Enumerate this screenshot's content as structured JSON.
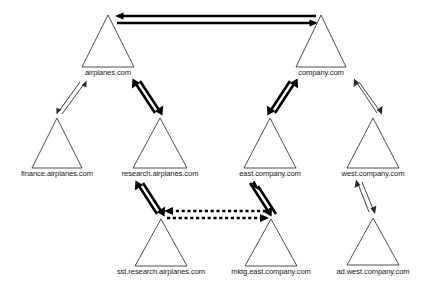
{
  "diagram": {
    "type": "tree-diagram",
    "shape": "triangle",
    "colors": {
      "background": "#ffffff",
      "triangle_stroke": "#3a3a3a",
      "triangle_fill": "#ffffff",
      "label_text": "#1a1a1a",
      "thin_link": "#2b2b2b",
      "thick_link": "#000000",
      "dashed_link": "#000000"
    },
    "nodes": [
      {
        "id": "airplanes",
        "label": "airplanes.com",
        "level": 1,
        "apex": {
          "x": 108,
          "y": 15
        },
        "base_y": 67,
        "half_width": 26,
        "label_y": 75
      },
      {
        "id": "company",
        "label": "company.com",
        "level": 1,
        "apex": {
          "x": 321,
          "y": 15
        },
        "base_y": 67,
        "half_width": 25,
        "label_y": 75
      },
      {
        "id": "finance-airplanes",
        "label": "finance.airplanes.com",
        "level": 2,
        "apex": {
          "x": 57,
          "y": 118
        },
        "base_y": 168,
        "half_width": 25,
        "label_y": 176
      },
      {
        "id": "research-airplanes",
        "label": "research.airplanes.com",
        "level": 2,
        "apex": {
          "x": 160,
          "y": 118
        },
        "base_y": 168,
        "half_width": 27,
        "label_y": 176
      },
      {
        "id": "east-company",
        "label": "east.company.com",
        "level": 2,
        "apex": {
          "x": 270,
          "y": 118
        },
        "base_y": 168,
        "half_width": 26,
        "label_y": 176
      },
      {
        "id": "west-company",
        "label": "west.company.com",
        "level": 2,
        "apex": {
          "x": 373,
          "y": 118
        },
        "base_y": 168,
        "half_width": 26,
        "label_y": 176
      },
      {
        "id": "sst-research-airplanes",
        "label": "sst.research.airplanes.com",
        "level": 3,
        "apex": {
          "x": 161,
          "y": 219
        },
        "base_y": 266,
        "half_width": 26,
        "label_y": 274
      },
      {
        "id": "mktg-east-company",
        "label": "mktg.east.company.com",
        "level": 3,
        "apex": {
          "x": 271,
          "y": 219
        },
        "base_y": 266,
        "half_width": 26,
        "label_y": 274
      },
      {
        "id": "ad-west-company",
        "label": "ad.west.company.com",
        "level": 3,
        "apex": {
          "x": 373,
          "y": 218
        },
        "base_y": 265,
        "half_width": 26,
        "label_y": 274
      }
    ],
    "links": [
      {
        "id": "airplanes-company",
        "from": "airplanes.com",
        "to": "company.com",
        "style": "thick",
        "direction": "bidirectional",
        "orientation": "horizontal",
        "line_a": {
          "x1": 316,
          "y1": 16,
          "x2": 117,
          "y2": 16
        },
        "line_b": {
          "x1": 117,
          "y1": 23,
          "x2": 316,
          "y2": 23
        }
      },
      {
        "id": "airplanes-finance",
        "from": "airplanes.com",
        "to": "finance.airplanes.com",
        "style": "thin",
        "direction": "bidirectional",
        "orientation": "diagonal",
        "line_a": {
          "x1": 62,
          "y1": 114,
          "x2": 85,
          "y2": 82
        },
        "line_b": {
          "x1": 80,
          "y1": 82,
          "x2": 57,
          "y2": 114
        }
      },
      {
        "id": "airplanes-research",
        "from": "airplanes.com",
        "to": "research.airplanes.com",
        "style": "thick",
        "direction": "bidirectional",
        "orientation": "diagonal",
        "line_a": {
          "x1": 155,
          "y1": 113,
          "x2": 133,
          "y2": 80
        },
        "line_b": {
          "x1": 139,
          "y1": 80,
          "x2": 161,
          "y2": 113
        }
      },
      {
        "id": "company-east",
        "from": "company.com",
        "to": "east.company.com",
        "style": "thick",
        "direction": "bidirectional",
        "orientation": "diagonal",
        "line_a": {
          "x1": 275,
          "y1": 113,
          "x2": 297,
          "y2": 80
        },
        "line_b": {
          "x1": 291,
          "y1": 80,
          "x2": 269,
          "y2": 113
        }
      },
      {
        "id": "company-west",
        "from": "company.com",
        "to": "west.company.com",
        "style": "thin",
        "direction": "bidirectional",
        "orientation": "diagonal",
        "line_a": {
          "x1": 377,
          "y1": 113,
          "x2": 354,
          "y2": 81
        },
        "line_b": {
          "x1": 359,
          "y1": 81,
          "x2": 382,
          "y2": 113
        }
      },
      {
        "id": "research-sst",
        "from": "research.airplanes.com",
        "to": "sst.research.airplanes.com",
        "style": "thick",
        "direction": "bidirectional",
        "orientation": "diagonal",
        "line_a": {
          "x1": 156,
          "y1": 214,
          "x2": 136,
          "y2": 181
        },
        "line_b": {
          "x1": 142,
          "y1": 181,
          "x2": 162,
          "y2": 214
        }
      },
      {
        "id": "east-mktg",
        "from": "east.company.com",
        "to": "mktg.east.company.com",
        "style": "thick",
        "direction": "bidirectional",
        "orientation": "diagonal",
        "line_a": {
          "x1": 275,
          "y1": 214,
          "x2": 255,
          "y2": 181
        },
        "line_b": {
          "x1": 249,
          "y1": 181,
          "x2": 269,
          "y2": 214
        }
      },
      {
        "id": "west-ad",
        "from": "west.company.com",
        "to": "ad.west.company.com",
        "style": "thin",
        "direction": "bidirectional",
        "orientation": "diagonal",
        "line_a": {
          "x1": 369,
          "y1": 213,
          "x2": 356,
          "y2": 181
        },
        "line_b": {
          "x1": 361,
          "y1": 181,
          "x2": 374,
          "y2": 213
        }
      },
      {
        "id": "sst-mktg",
        "from": "sst.research.airplanes.com",
        "to": "mktg.east.company.com",
        "style": "dashed",
        "direction": "bidirectional",
        "orientation": "horizontal",
        "line_a": {
          "x1": 266,
          "y1": 211,
          "x2": 167,
          "y2": 211
        },
        "line_b": {
          "x1": 167,
          "y1": 218,
          "x2": 266,
          "y2": 218
        }
      }
    ]
  }
}
